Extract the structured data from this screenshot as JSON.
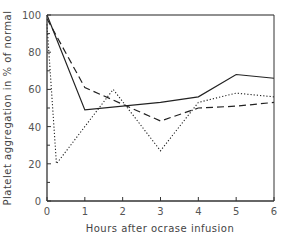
{
  "chart_data": {
    "type": "line",
    "title": "",
    "xlabel": "Hours after ocrase infusion",
    "ylabel": "Platelet aggregation in % of normal",
    "xlim": [
      0,
      6
    ],
    "ylim": [
      0,
      100
    ],
    "xticks": [
      0,
      1,
      2,
      3,
      4,
      5,
      6
    ],
    "yticks": [
      0,
      20,
      40,
      60,
      80,
      100
    ],
    "grid": false,
    "legend": null,
    "series": [
      {
        "name": "solid",
        "style": "solid",
        "x": [
          0,
          1,
          3,
          4,
          5,
          6
        ],
        "y": [
          100,
          49,
          53,
          56,
          68,
          66
        ]
      },
      {
        "name": "dashed",
        "style": "dashed",
        "x": [
          0,
          1,
          2,
          3,
          4,
          5,
          6
        ],
        "y": [
          98,
          61,
          52,
          43,
          50,
          51,
          53
        ]
      },
      {
        "name": "dotted",
        "style": "dotted",
        "x": [
          0,
          0.25,
          1.75,
          3,
          4,
          5,
          6
        ],
        "y": [
          95,
          20,
          60,
          27,
          53,
          58,
          56
        ]
      },
      {
        "name": "reference",
        "style": "solid",
        "x": [
          0,
          6
        ],
        "y": [
          100,
          100
        ]
      }
    ]
  }
}
